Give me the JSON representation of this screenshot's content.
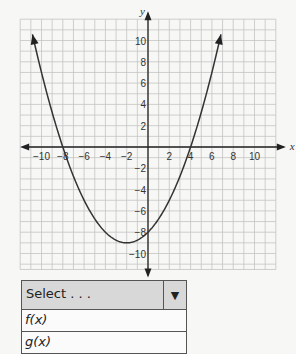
{
  "chart_data": {
    "type": "line",
    "title": "",
    "xlabel": "x",
    "ylabel": "y",
    "xlim": [
      -12,
      12
    ],
    "ylim": [
      -11.5,
      12
    ],
    "grid": true,
    "x_ticks": [
      -10,
      -8,
      -6,
      -4,
      -2,
      2,
      4,
      6,
      8,
      10
    ],
    "y_ticks": [
      10,
      8,
      6,
      4,
      2,
      -2,
      -4,
      -6,
      -8,
      -10
    ],
    "series": [
      {
        "name": "parabola",
        "equation": "y = 0.25(x + 8)(x - 4)",
        "x_intercepts": [
          -8,
          4
        ],
        "y_intercept": -8,
        "vertex": [
          -2,
          -9
        ],
        "x": [
          -10.8,
          -10,
          -8,
          -6,
          -4,
          -2,
          0,
          2,
          4,
          6,
          6.8
        ],
        "values": [
          11.0,
          7,
          0,
          -5,
          -8,
          -9,
          -8,
          -5,
          0,
          7,
          11.0
        ]
      }
    ]
  },
  "axes": {
    "x_label": "x",
    "y_label": "y"
  },
  "dropdown": {
    "selected": "Select . . .",
    "arrow": "▼",
    "options": [
      "f(x)",
      "g(x)"
    ]
  }
}
